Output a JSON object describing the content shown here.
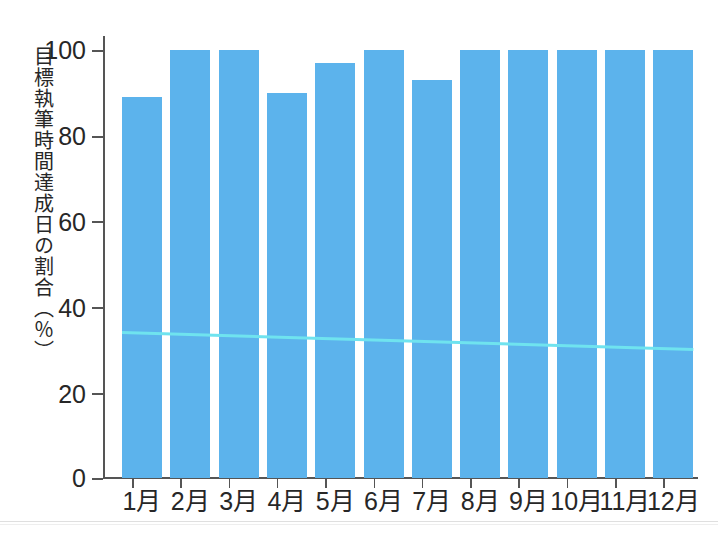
{
  "chart_data": {
    "type": "bar",
    "title": "",
    "xlabel": "",
    "ylabel": "目標執筆時間達成日の割合（％）",
    "categories": [
      "1月",
      "2月",
      "3月",
      "4月",
      "5月",
      "6月",
      "7月",
      "8月",
      "9月",
      "10月",
      "11月",
      "12月"
    ],
    "values": [
      89,
      100,
      100,
      90,
      97,
      100,
      93,
      100,
      100,
      100,
      100,
      100
    ],
    "ylim": [
      0,
      100
    ],
    "ytick_labels": [
      "0",
      "20",
      "40",
      "60",
      "80",
      "100"
    ],
    "ytick_values": [
      0,
      20,
      40,
      60,
      80,
      100
    ],
    "grid": false,
    "legend": "none",
    "bar_color": "#5cb3ec",
    "series": [
      {
        "name": "目標執筆時間達成日の割合",
        "type": "bar",
        "values": [
          89,
          100,
          100,
          90,
          97,
          100,
          93,
          100,
          100,
          100,
          100,
          100
        ]
      },
      {
        "name": "trend-line",
        "type": "line",
        "color": "#6fe3ef",
        "values": [
          34,
          33.6,
          33.2,
          32.8,
          32.4,
          32.0,
          31.6,
          31.3,
          31.0,
          30.7,
          30.3,
          30.0
        ]
      }
    ]
  },
  "axis": {
    "y_title": "目標執筆時間達成日の割合（％）",
    "y_ticks": [
      {
        "label": "100",
        "value": 100
      },
      {
        "label": "80",
        "value": 80
      },
      {
        "label": "60",
        "value": 60
      },
      {
        "label": "40",
        "value": 40
      },
      {
        "label": "20",
        "value": 20
      },
      {
        "label": "0",
        "value": 0
      }
    ],
    "x_ticks": [
      "1月",
      "2月",
      "3月",
      "4月",
      "5月",
      "6月",
      "7月",
      "8月",
      "9月",
      "10月",
      "11月",
      "12月"
    ]
  },
  "colors": {
    "bar": "#5cb3ec",
    "trend": "#6fe3ef",
    "axis": "#555555",
    "text": "#272727",
    "background": "#ffffff"
  }
}
